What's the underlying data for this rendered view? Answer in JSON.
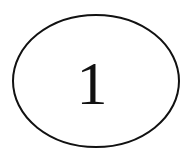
{
  "canvas": {
    "width": 193,
    "height": 162,
    "background_color": "#ffffff"
  },
  "diagram": {
    "type": "node-graph",
    "node_count": 1,
    "nodes": [
      {
        "id": "node-1",
        "label": "1",
        "shape": "ellipse",
        "center_x": 96,
        "center_y": 81,
        "radius_x": 83,
        "radius_y": 66,
        "stroke_color": "#111111",
        "stroke_width": 2,
        "fill_color": "#ffffff",
        "label_color": "#111111",
        "label_font_size": 62,
        "label_x": 92,
        "label_y": 83
      }
    ],
    "edges": []
  }
}
